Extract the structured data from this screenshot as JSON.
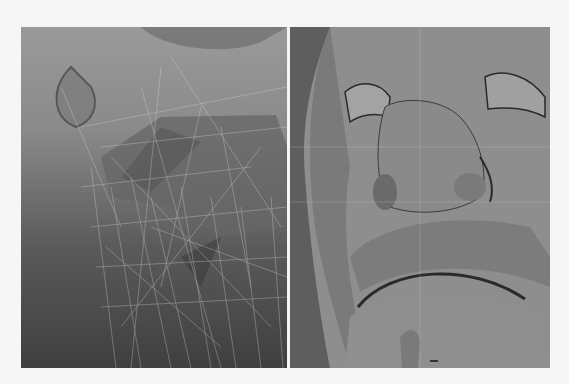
{
  "figure": {
    "panels": [
      {
        "id": "left",
        "view": "wireframe-overlay",
        "description": "Face mesh with wireframe overlay, lower face / chin region"
      },
      {
        "id": "right",
        "view": "shaded",
        "description": "Shaded face model viewed from below: nose, eyes, upper lip, mouth"
      }
    ],
    "colors": {
      "page_background": "#f6f6f6",
      "left_top": "#9a9a9a",
      "left_bottom": "#3f3f3f",
      "right_surface": "#8e8e8e",
      "wire_lines": "#d8d8d8",
      "crease_dark": "#2a2a2a"
    }
  }
}
